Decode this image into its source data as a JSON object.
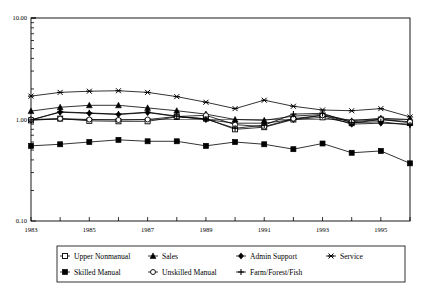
{
  "chart_data": {
    "type": "line",
    "title": "",
    "subtitle": "",
    "xlabel": "",
    "ylabel": "",
    "yscale": "log",
    "ylim": [
      0.1,
      10.0
    ],
    "ytick_labels": [
      "10.00",
      "1.00",
      "0.10"
    ],
    "ytick_values": [
      10.0,
      1.0,
      0.1
    ],
    "xlim": [
      1983,
      1996
    ],
    "x": [
      1983,
      1984,
      1985,
      1986,
      1987,
      1988,
      1989,
      1990,
      1991,
      1992,
      1993,
      1994,
      1995,
      1996
    ],
    "xtick_labels": [
      "1983",
      "1985",
      "1987",
      "1989",
      "1991",
      "1993",
      "1995"
    ],
    "xtick_values": [
      1983,
      1985,
      1987,
      1989,
      1991,
      1993,
      1995
    ],
    "grid": false,
    "legend_position": "bottom",
    "reference_line": 1.0,
    "series": [
      {
        "name": "Upper Nonmanual",
        "marker": "open-square",
        "values": [
          0.98,
          1.02,
          0.97,
          0.96,
          0.96,
          1.06,
          1.02,
          0.8,
          0.84,
          1.0,
          1.05,
          0.92,
          1.0,
          0.93
        ]
      },
      {
        "name": "Sales",
        "marker": "filled-triangle",
        "values": [
          1.21,
          1.32,
          1.38,
          1.38,
          1.3,
          1.22,
          1.13,
          1.0,
          0.98,
          1.08,
          1.12,
          0.97,
          1.03,
          1.0
        ]
      },
      {
        "name": "Admin Support",
        "marker": "filled-diamond",
        "values": [
          0.99,
          1.18,
          1.15,
          1.12,
          1.17,
          1.07,
          1.0,
          0.92,
          0.92,
          1.0,
          1.1,
          0.9,
          0.92,
          0.9
        ]
      },
      {
        "name": "Service",
        "marker": "star-x",
        "values": [
          1.7,
          1.85,
          1.9,
          1.92,
          1.85,
          1.68,
          1.48,
          1.28,
          1.55,
          1.35,
          1.24,
          1.22,
          1.28,
          1.06
        ]
      },
      {
        "name": "Skilled Manual",
        "marker": "filled-square",
        "values": [
          0.55,
          0.57,
          0.6,
          0.63,
          0.61,
          0.61,
          0.55,
          0.6,
          0.57,
          0.51,
          0.58,
          0.47,
          0.49,
          0.37
        ]
      },
      {
        "name": "Unskilled Manual",
        "marker": "open-circle",
        "values": [
          1.0,
          1.02,
          1.0,
          0.99,
          1.0,
          1.07,
          1.1,
          0.89,
          0.85,
          1.02,
          1.1,
          0.95,
          1.0,
          0.95
        ]
      },
      {
        "name": "Farm/Forest/Fish",
        "marker": "plus",
        "values": [
          0.99,
          1.19,
          1.16,
          1.13,
          1.18,
          1.08,
          1.01,
          0.82,
          0.88,
          1.13,
          1.15,
          0.93,
          0.95,
          0.88
        ]
      }
    ]
  },
  "legend": {
    "items": [
      {
        "label": "Upper Nonmanual",
        "marker": "open-square"
      },
      {
        "label": "Sales",
        "marker": "filled-triangle"
      },
      {
        "label": "Admin Support",
        "marker": "filled-diamond"
      },
      {
        "label": "Service",
        "marker": "star-x"
      },
      {
        "label": "Skilled Manual",
        "marker": "filled-square"
      },
      {
        "label": "Unskilled Manual",
        "marker": "open-circle"
      },
      {
        "label": "Farm/Forest/Fish",
        "marker": "plus"
      }
    ]
  },
  "colors": {
    "line": "#000000",
    "axis": "#000000",
    "background": "#ffffff"
  }
}
